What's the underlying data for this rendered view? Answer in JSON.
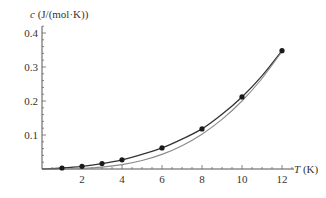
{
  "chart_data": {
    "type": "line",
    "title": "",
    "xlabel": "T (K)",
    "ylabel": "c (J/(mol·K))",
    "xlabel_italic_part": "T",
    "xlabel_unit_part": " (K)",
    "ylabel_italic_part": "c",
    "ylabel_unit_part": " (J/(mol·K))",
    "xlim": [
      0,
      12.6
    ],
    "ylim": [
      0,
      0.42
    ],
    "x_ticks": [
      2,
      4,
      6,
      8,
      10,
      12
    ],
    "x_tick_labels": [
      "2",
      "4",
      "6",
      "8",
      "10",
      "12"
    ],
    "y_ticks": [
      0.1,
      0.2,
      0.3,
      0.4
    ],
    "y_tick_labels": [
      "0.1",
      "0.2",
      "0.3",
      "0.4"
    ],
    "grid": false,
    "legend": null,
    "series": [
      {
        "name": "measured",
        "kind": "scatter",
        "color": "#1a1a1a",
        "x": [
          1,
          2,
          3,
          4,
          6,
          8,
          10,
          12
        ],
        "y": [
          0.003,
          0.008,
          0.016,
          0.027,
          0.062,
          0.118,
          0.212,
          0.348
        ]
      },
      {
        "name": "fit (aT + bT^3)",
        "kind": "line",
        "color": "#333333",
        "x": [
          0,
          1,
          2,
          3,
          4,
          5,
          6,
          7,
          8,
          9,
          10,
          11,
          12
        ],
        "y": [
          0,
          0.003,
          0.008,
          0.016,
          0.027,
          0.043,
          0.062,
          0.088,
          0.118,
          0.161,
          0.212,
          0.274,
          0.348
        ]
      },
      {
        "name": "T^3 term",
        "kind": "line",
        "color": "#8a8a8a",
        "x": [
          0,
          1,
          2,
          3,
          4,
          5,
          6,
          7,
          8,
          9,
          10,
          11,
          12
        ],
        "y": [
          0,
          0.0002,
          0.0016,
          0.0054,
          0.0128,
          0.025,
          0.043,
          0.0686,
          0.1024,
          0.1458,
          0.2,
          0.2662,
          0.3456
        ]
      }
    ]
  }
}
